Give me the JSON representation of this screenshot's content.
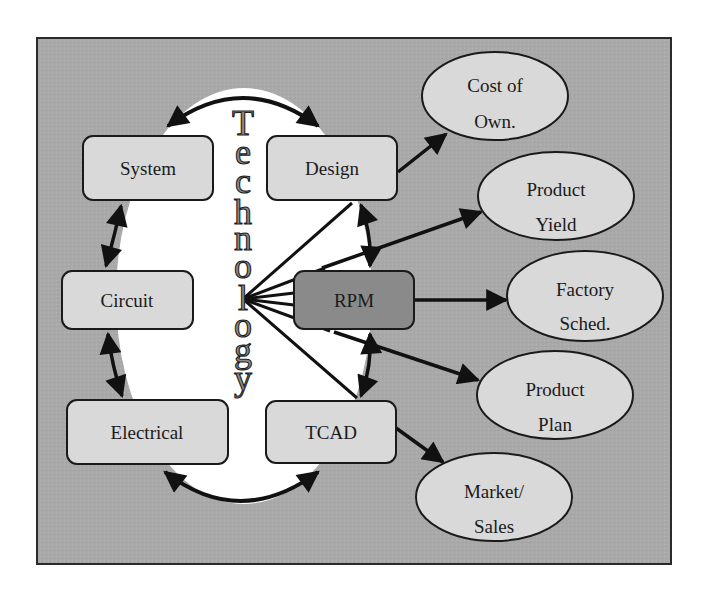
{
  "colors": {
    "page_background": "#ffffff",
    "frame_fill": "#a9a9a9",
    "frame_border": "#2a2a2a",
    "center_ellipse": "#ffffff",
    "box_fill": "#d9d9d9",
    "rpm_fill": "#8a8a8a",
    "oval_fill": "#d9d9d9",
    "stroke": "#111111",
    "tech_text_fill": "#8c8c8c"
  },
  "center": {
    "vertical_title": "Technology",
    "letters": [
      "T",
      "e",
      "c",
      "h",
      "n",
      "o",
      "l",
      "o",
      "g",
      "y"
    ]
  },
  "boxes": {
    "system": {
      "label": "System"
    },
    "design": {
      "label": "Design"
    },
    "circuit": {
      "label": "Circuit"
    },
    "rpm": {
      "label": "RPM"
    },
    "electrical": {
      "label": "Electrical"
    },
    "tcad": {
      "label": "TCAD"
    }
  },
  "outputs": {
    "cost_of_own": {
      "line1": "Cost of",
      "line2": "Own."
    },
    "product_yield": {
      "line1": "Product",
      "line2": "Yield"
    },
    "factory_sched": {
      "line1": "Factory",
      "line2": "Sched."
    },
    "product_plan": {
      "line1": "Product",
      "line2": "Plan"
    },
    "market_sales": {
      "line1": "Market/",
      "line2": "Sales"
    }
  },
  "edges": [
    {
      "from": "System",
      "to": "Design",
      "type": "bidirectional-arc"
    },
    {
      "from": "System",
      "to": "Circuit",
      "type": "bidirectional"
    },
    {
      "from": "Circuit",
      "to": "Electrical",
      "type": "bidirectional"
    },
    {
      "from": "Electrical",
      "to": "TCAD",
      "type": "bidirectional-arc"
    },
    {
      "from": "Design",
      "to": "RPM",
      "type": "bidirectional"
    },
    {
      "from": "RPM",
      "to": "TCAD",
      "type": "bidirectional"
    },
    {
      "from": "Technology",
      "to": "Design",
      "type": "line"
    },
    {
      "from": "Technology",
      "to": "RPM",
      "type": "line"
    },
    {
      "from": "Technology",
      "to": "TCAD",
      "type": "line"
    },
    {
      "from": "Design",
      "to": "Cost of Own.",
      "type": "arrow"
    },
    {
      "from": "RPM",
      "to": "Product Yield",
      "type": "arrow"
    },
    {
      "from": "RPM",
      "to": "Factory Sched.",
      "type": "arrow"
    },
    {
      "from": "RPM",
      "to": "Product Plan",
      "type": "arrow"
    },
    {
      "from": "TCAD",
      "to": "Market/Sales",
      "type": "arrow"
    }
  ]
}
